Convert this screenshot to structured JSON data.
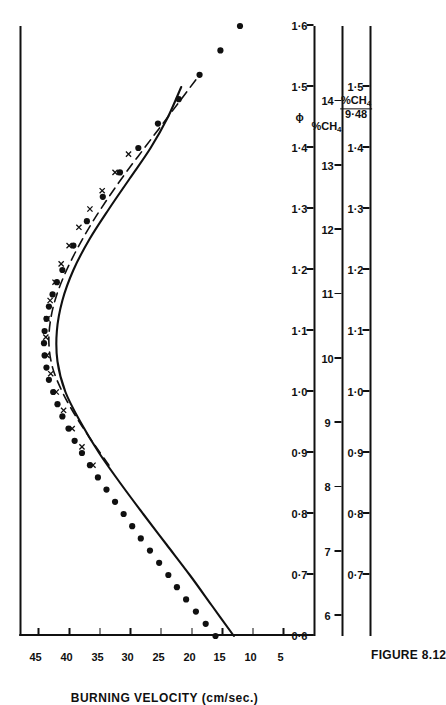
{
  "figure": {
    "caption": "FIGURE 8.12",
    "number": "8.12"
  },
  "yaxis": {
    "title": "BURNING VELOCITY (cm/sec.)",
    "ticks": [
      5,
      10,
      15,
      20,
      25,
      30,
      35,
      40,
      45
    ],
    "min": 0,
    "max": 48
  },
  "xaxes": [
    {
      "id": "phi",
      "title": "ϕ",
      "ticks": [
        "0·6",
        "0·7",
        "0·8",
        "0·9",
        "1·0",
        "1·1",
        "1·2",
        "1·3",
        "1·4",
        "1·5",
        "1·6"
      ],
      "values": [
        0.6,
        0.7,
        0.8,
        0.9,
        1.0,
        1.1,
        1.2,
        1.3,
        1.4,
        1.5,
        1.6
      ]
    },
    {
      "id": "pct-ch4",
      "title": "%CH4",
      "ticks": [
        "6",
        "7",
        "8",
        "9",
        "10",
        "11",
        "12",
        "13",
        "14"
      ],
      "values": [
        6,
        7,
        8,
        9,
        10,
        11,
        12,
        13,
        14
      ]
    },
    {
      "id": "pct-ch4-over-948",
      "title_numerator": "%CH4",
      "title_denominator": "9·48",
      "ticks": [
        "0",
        "0·7",
        "0·8",
        "0·9",
        "1·0",
        "1·1",
        "1·2",
        "1·3",
        "1·4",
        "1·5"
      ],
      "values": [
        0,
        0.7,
        0.8,
        0.9,
        1.0,
        1.1,
        1.2,
        1.3,
        1.4,
        1.5
      ]
    }
  ],
  "chart_data": {
    "type": "line",
    "title": "FIGURE 8.12",
    "xlabel": "ϕ",
    "ylabel": "BURNING VELOCITY (cm/sec.)",
    "xlim": [
      0.6,
      1.6
    ],
    "ylim": [
      0,
      48
    ],
    "grid": false,
    "legend": "none",
    "series": [
      {
        "name": "solid-curve",
        "style": "solid-line",
        "x": [
          0.6,
          0.65,
          0.7,
          0.75,
          0.8,
          0.85,
          0.9,
          0.95,
          1.0,
          1.05,
          1.1,
          1.15,
          1.2,
          1.25,
          1.3,
          1.35,
          1.4,
          1.45,
          1.5
        ],
        "y": [
          13.0,
          16.6,
          20.2,
          24.0,
          27.8,
          31.5,
          35.0,
          38.0,
          40.5,
          41.8,
          41.9,
          41.0,
          39.2,
          36.6,
          33.4,
          30.0,
          26.6,
          23.8,
          21.6
        ]
      },
      {
        "name": "dashed-curve",
        "style": "dashed-line",
        "x": [
          0.88,
          0.92,
          0.96,
          1.0,
          1.04,
          1.08,
          1.12,
          1.16,
          1.2,
          1.24,
          1.28,
          1.32,
          1.36,
          1.4,
          1.44,
          1.48,
          1.52
        ],
        "y": [
          33.4,
          36.2,
          38.8,
          41.0,
          42.6,
          43.2,
          42.9,
          41.9,
          40.3,
          38.3,
          36.0,
          33.4,
          30.6,
          27.6,
          24.6,
          21.6,
          18.6
        ]
      },
      {
        "name": "filled-circle-points",
        "style": "filled-circles",
        "x": [
          0.6,
          0.62,
          0.64,
          0.66,
          0.68,
          0.7,
          0.72,
          0.74,
          0.76,
          0.78,
          0.8,
          0.82,
          0.84,
          0.86,
          0.88,
          0.9,
          0.92,
          0.94,
          0.96,
          0.98,
          1.0,
          1.02,
          1.04,
          1.06,
          1.08,
          1.1,
          1.12,
          1.14,
          1.16,
          1.18,
          1.2,
          1.24,
          1.28,
          1.32,
          1.36,
          1.4,
          1.44,
          1.48,
          1.52,
          1.56,
          1.6
        ],
        "y": [
          16.0,
          17.6,
          19.2,
          20.8,
          22.3,
          23.7,
          25.2,
          26.7,
          28.2,
          29.6,
          31.0,
          32.4,
          33.8,
          35.2,
          36.5,
          37.8,
          39.0,
          40.0,
          41.0,
          41.8,
          42.5,
          43.2,
          43.6,
          43.9,
          44.0,
          43.9,
          43.6,
          43.2,
          42.6,
          41.9,
          41.0,
          39.2,
          37.0,
          34.4,
          31.6,
          28.6,
          25.4,
          22.0,
          18.6,
          15.2,
          12.0
        ]
      },
      {
        "name": "cross-marker-points",
        "style": "x-markers",
        "x": [
          0.88,
          0.91,
          0.94,
          0.97,
          1.0,
          1.03,
          1.06,
          1.09,
          1.12,
          1.15,
          1.18,
          1.21,
          1.24,
          1.27,
          1.3,
          1.33,
          1.36,
          1.39
        ],
        "y": [
          36.0,
          37.8,
          39.4,
          40.8,
          42.0,
          42.9,
          43.5,
          43.7,
          43.5,
          43.0,
          42.2,
          41.2,
          39.9,
          38.3,
          36.5,
          34.5,
          32.4,
          30.2
        ]
      }
    ]
  }
}
